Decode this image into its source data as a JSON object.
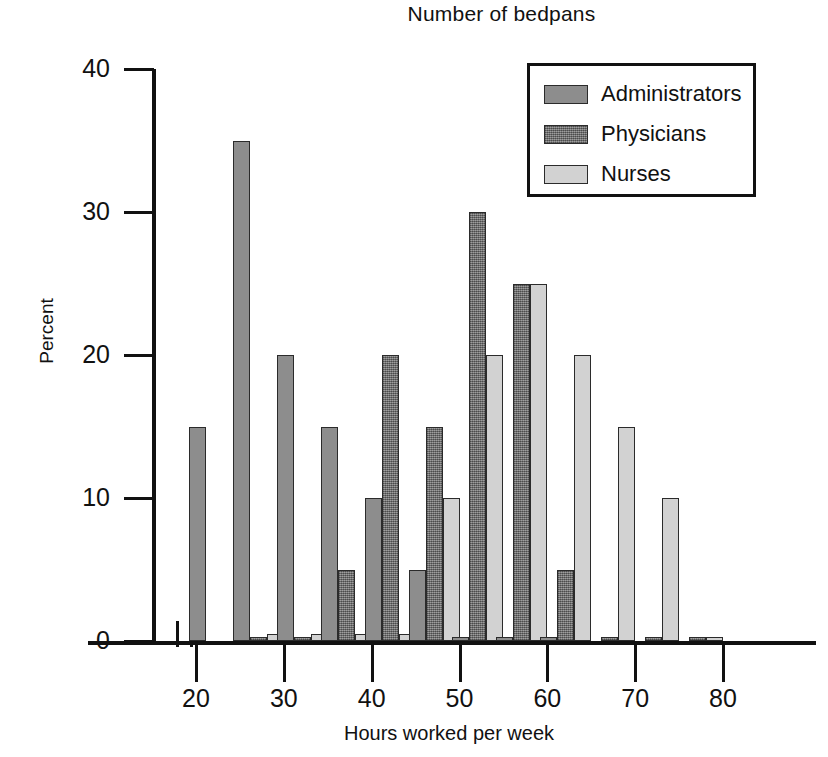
{
  "chart_data": {
    "type": "bar",
    "title": "Number of bedpans",
    "xlabel": "Hours worked per week",
    "ylabel": "Percent",
    "xlim": [
      20,
      82.5
    ],
    "ylim": [
      0,
      40
    ],
    "x_ticks": [
      20,
      30,
      40,
      50,
      60,
      70,
      80
    ],
    "y_ticks": [
      0,
      10,
      20,
      30,
      40
    ],
    "grid": false,
    "axis_break": true,
    "legend_position": "top-right",
    "categories": [
      25,
      30,
      35,
      40,
      45,
      50,
      55,
      60,
      65,
      70,
      75,
      80
    ],
    "series": [
      {
        "name": "Administrators",
        "color": "#8d8d8d",
        "values": [
          15,
          35,
          20,
          15,
          10,
          5,
          0.3,
          0.3,
          0.3,
          0,
          0,
          0
        ]
      },
      {
        "name": "Physicians",
        "color": "#767676",
        "values": [
          0,
          0.3,
          0.3,
          5,
          20,
          15,
          30,
          25,
          5,
          0.3,
          0.3,
          0.3
        ]
      },
      {
        "name": "Nurses",
        "color": "#d2d2d2",
        "values": [
          0,
          0.5,
          0.5,
          0.5,
          0.5,
          10,
          20,
          25,
          20,
          15,
          10,
          0.3
        ]
      }
    ]
  },
  "axis": {
    "y_tick_labels": [
      "0",
      "10",
      "20",
      "30",
      "40"
    ],
    "x_tick_labels": [
      "20",
      "30",
      "40",
      "50",
      "60",
      "70",
      "80"
    ]
  },
  "legend": {
    "items": [
      {
        "label": "Administrators"
      },
      {
        "label": "Physicians"
      },
      {
        "label": "Nurses"
      }
    ]
  }
}
